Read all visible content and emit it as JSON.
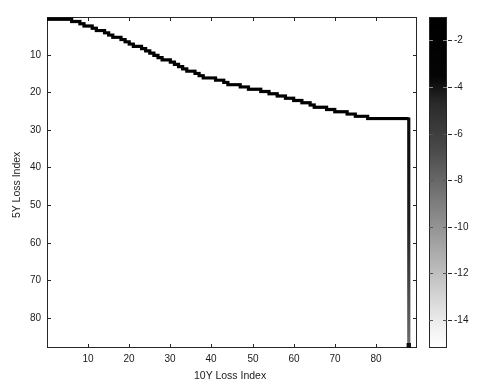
{
  "figure": {
    "width": 482,
    "height": 389,
    "background": "#ffffff",
    "axis_color": "#262626",
    "line_color": "#000000"
  },
  "axes": {
    "left": 47,
    "top": 17,
    "width": 370,
    "height": 331
  },
  "chart_data": {
    "type": "line",
    "title": "",
    "subtitle": "",
    "xlabel": "10Y Loss Index",
    "ylabel": "5Y Loss Index",
    "xlim": [
      0,
      90
    ],
    "ylim": [
      0,
      88
    ],
    "y_inverted": true,
    "grid": false,
    "legend": null,
    "xticks": [
      10,
      20,
      30,
      40,
      50,
      60,
      70,
      80
    ],
    "xticklabels": [
      "10",
      "20",
      "30",
      "40",
      "50",
      "60",
      "70",
      "80"
    ],
    "yticks": [
      10,
      20,
      30,
      40,
      50,
      60,
      70,
      80
    ],
    "yticklabels": [
      "10",
      "20",
      "30",
      "40",
      "50",
      "60",
      "70",
      "80"
    ],
    "series": [
      {
        "name": "loss-index-boundary",
        "style": "staircase",
        "linewidth": 3.2,
        "color": "#000000",
        "x": [
          0,
          1,
          2,
          3,
          4,
          5,
          6,
          7,
          8,
          9,
          10,
          11,
          12,
          13,
          14,
          15,
          16,
          17,
          18,
          19,
          20,
          21,
          22,
          23,
          24,
          25,
          26,
          27,
          28,
          29,
          30,
          31,
          32,
          33,
          34,
          35,
          36,
          37,
          38,
          39,
          40,
          41,
          42,
          43,
          44,
          45,
          46,
          47,
          48,
          49,
          50,
          51,
          52,
          53,
          54,
          55,
          56,
          57,
          58,
          59,
          60,
          61,
          62,
          63,
          64,
          65,
          66,
          67,
          68,
          69,
          70,
          71,
          72,
          73,
          74,
          75,
          76,
          77,
          78,
          79,
          80,
          81,
          82,
          83,
          84,
          85,
          86,
          87,
          88
        ],
        "y": [
          0.6,
          0.6,
          0.6,
          0.6,
          0.6,
          0.6,
          1.2,
          1.2,
          1.8,
          2.4,
          2.4,
          3.0,
          3.6,
          3.6,
          4.2,
          4.8,
          5.4,
          5.4,
          6.0,
          6.6,
          7.2,
          7.8,
          7.8,
          8.4,
          9.0,
          9.6,
          10.2,
          10.8,
          11.4,
          11.4,
          12.0,
          12.6,
          13.2,
          13.8,
          14.4,
          14.4,
          15.0,
          15.6,
          16.2,
          16.2,
          16.2,
          16.8,
          16.8,
          17.4,
          18.0,
          18.0,
          18.0,
          18.6,
          18.6,
          19.2,
          19.2,
          19.2,
          19.8,
          19.8,
          20.4,
          20.4,
          21.0,
          21.0,
          21.6,
          21.6,
          22.2,
          22.2,
          22.8,
          22.8,
          23.4,
          24.0,
          24.0,
          24.0,
          24.6,
          24.6,
          25.2,
          25.2,
          25.2,
          25.8,
          25.8,
          26.4,
          26.4,
          26.4,
          27.0,
          27.0,
          27.0,
          27.0,
          27.0,
          27.0,
          27.0,
          27.0,
          27.0,
          27.0,
          27.0
        ]
      },
      {
        "name": "right-edge-drop",
        "style": "vertical-gradient-line",
        "linewidth": 3.2,
        "x": 88,
        "y_from": 27.0,
        "y_to": 88,
        "color_top": "#0a0a0a",
        "color_bottom": "#6e6e6e"
      }
    ]
  },
  "colorbar": {
    "left": 429,
    "top": 17,
    "width": 18,
    "height": 331,
    "orientation": "vertical",
    "colormap": "gray-reversed",
    "color_top": "#000000",
    "color_bottom": "#ffffff",
    "vmin": -15.2,
    "vmax": -1.0,
    "ticks": [
      -2,
      -4,
      -6,
      -8,
      -10,
      -12,
      -14
    ],
    "ticklabels": [
      "-2",
      "-4",
      "-6",
      "-8",
      "-10",
      "-12",
      "-14"
    ]
  }
}
